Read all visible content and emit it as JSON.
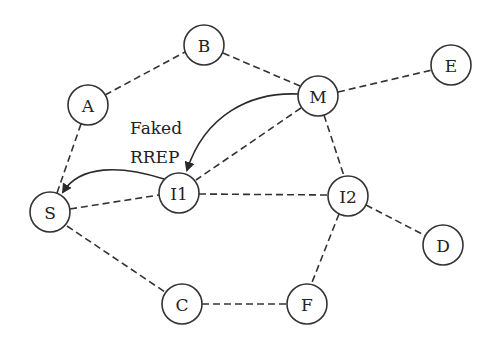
{
  "diagram": {
    "title": "",
    "nodes": [
      {
        "id": "A",
        "label": "A",
        "x": 88,
        "y": 105
      },
      {
        "id": "B",
        "label": "B",
        "x": 204,
        "y": 45
      },
      {
        "id": "M",
        "label": "M",
        "x": 318,
        "y": 96
      },
      {
        "id": "E",
        "label": "E",
        "x": 451,
        "y": 65
      },
      {
        "id": "S",
        "label": "S",
        "x": 50,
        "y": 212
      },
      {
        "id": "I1",
        "label": "I1",
        "x": 179,
        "y": 193
      },
      {
        "id": "I2",
        "label": "I2",
        "x": 348,
        "y": 196
      },
      {
        "id": "D",
        "label": "D",
        "x": 443,
        "y": 245
      },
      {
        "id": "C",
        "label": "C",
        "x": 182,
        "y": 304
      },
      {
        "id": "F",
        "label": "F",
        "x": 307,
        "y": 304
      }
    ],
    "edges": [
      {
        "from": "A",
        "to": "B",
        "style": "dashed"
      },
      {
        "from": "B",
        "to": "M",
        "style": "dashed"
      },
      {
        "from": "M",
        "to": "E",
        "style": "dashed"
      },
      {
        "from": "A",
        "to": "S",
        "style": "dashed"
      },
      {
        "from": "M",
        "to": "I1",
        "style": "dashed"
      },
      {
        "from": "M",
        "to": "I2",
        "style": "dashed"
      },
      {
        "from": "S",
        "to": "I1",
        "style": "dashed"
      },
      {
        "from": "I1",
        "to": "I2",
        "style": "dashed"
      },
      {
        "from": "I2",
        "to": "D",
        "style": "dashed"
      },
      {
        "from": "I2",
        "to": "F",
        "style": "dashed"
      },
      {
        "from": "S",
        "to": "C",
        "style": "dashed"
      },
      {
        "from": "C",
        "to": "F",
        "style": "dashed"
      }
    ],
    "arrows": [
      {
        "from": "M",
        "to": "I1",
        "style": "solid-curved",
        "meaning": "Faked RREP"
      },
      {
        "from": "I1",
        "to": "S",
        "style": "solid-curved",
        "meaning": "Faked RREP"
      }
    ],
    "annotation": {
      "line1": "Faked",
      "line2": "RREP"
    },
    "colors": {
      "stroke": "#333333",
      "background": "#ffffff",
      "text": "#222222"
    }
  }
}
